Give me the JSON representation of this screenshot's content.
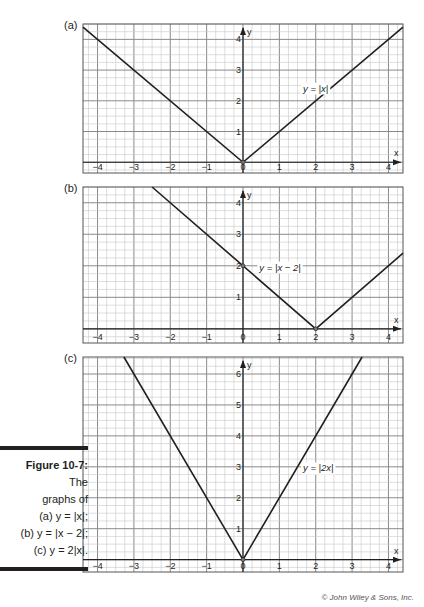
{
  "figure": {
    "caption_title": "Figure 10-7:",
    "caption_lines": [
      "The",
      "graphs of",
      "(a) y = |x|;",
      "(b) y = |x − 2|;",
      "(c) y = 2|x|."
    ],
    "credit": "© John Wiley & Sons, Inc."
  },
  "colors": {
    "line": "#231f20",
    "major_grid": "#8a8a8a",
    "minor_grid": "#c8c8c8",
    "frame": "#555555"
  },
  "chart_data": [
    {
      "type": "line",
      "panel": "(a)",
      "title": "",
      "equation_label": "y = |x|",
      "xlabel": "x",
      "ylabel": "y",
      "xlim": [
        -4.4,
        4.4
      ],
      "ylim": [
        -0.35,
        4.5
      ],
      "x_ticks": [
        -4,
        -3,
        -2,
        -1,
        0,
        1,
        2,
        3,
        4
      ],
      "y_ticks": [
        1,
        2,
        3,
        4
      ],
      "grid": true,
      "minor_step": 0.25,
      "x": [
        -4.4,
        0,
        4.4
      ],
      "y": [
        4.4,
        0,
        4.4
      ],
      "label_at": [
        1.65,
        2.3
      ],
      "frame": {
        "left": 83,
        "top": 24,
        "right": 403,
        "bottom": 173
      }
    },
    {
      "type": "line",
      "panel": "(b)",
      "title": "",
      "equation_label": "y = |x − 2|",
      "xlabel": "x",
      "ylabel": "y",
      "xlim": [
        -4.4,
        4.4
      ],
      "ylim": [
        -0.45,
        4.5
      ],
      "x_ticks": [
        -4,
        -3,
        -2,
        -1,
        0,
        1,
        2,
        3,
        4
      ],
      "y_ticks": [
        1,
        2,
        3,
        4
      ],
      "grid": true,
      "minor_step": 0.25,
      "x": [
        -2.5,
        2,
        4.4
      ],
      "y": [
        4.5,
        0,
        2.4
      ],
      "label_at": [
        0.45,
        1.85
      ],
      "frame": {
        "left": 83,
        "top": 187,
        "right": 403,
        "bottom": 343
      }
    },
    {
      "type": "line",
      "panel": "(c)",
      "title": "",
      "equation_label": "y = |2x|",
      "xlabel": "x",
      "ylabel": "y",
      "xlim": [
        -4.4,
        4.4
      ],
      "ylim": [
        -0.4,
        6.55
      ],
      "x_ticks": [
        -4,
        -3,
        -2,
        -1,
        0,
        1,
        2,
        3,
        4
      ],
      "y_ticks": [
        1,
        2,
        3,
        4,
        5,
        6
      ],
      "grid": true,
      "minor_step": 0.25,
      "x": [
        -3.275,
        0,
        3.275
      ],
      "y": [
        6.55,
        0,
        6.55
      ],
      "label_at": [
        1.65,
        2.85
      ],
      "frame": {
        "left": 83,
        "top": 357,
        "right": 403,
        "bottom": 572
      }
    }
  ]
}
